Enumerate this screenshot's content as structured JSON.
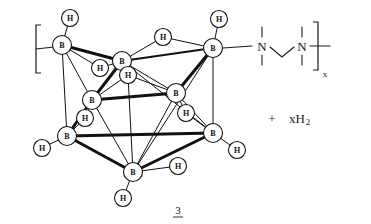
{
  "figure": {
    "kind": "chemical-reaction-scheme",
    "compound_number": "3",
    "compound_number_underlined": true,
    "description_labels": {
      "boron_vertex": "B",
      "hydrogen_atom": "H",
      "nitrogen_atom": "N"
    }
  },
  "colors": {
    "ink": "#111111",
    "text": "#1a1a1a",
    "background": "#ffffff",
    "node_fill": "#ffffff"
  },
  "cluster": {
    "name": "polyhedral-borane-cage",
    "boron_vertices": [
      {
        "id": "B1",
        "label": "B",
        "x": 62,
        "y": 45
      },
      {
        "id": "B2",
        "label": "B",
        "x": 122,
        "y": 61
      },
      {
        "id": "B3",
        "label": "B",
        "x": 213,
        "y": 48
      },
      {
        "id": "B4",
        "label": "B",
        "x": 92,
        "y": 100
      },
      {
        "id": "B5",
        "label": "B",
        "x": 176,
        "y": 93
      },
      {
        "id": "B6",
        "label": "B",
        "x": 67,
        "y": 136
      },
      {
        "id": "B7",
        "label": "B",
        "x": 213,
        "y": 133
      },
      {
        "id": "B8",
        "label": "B",
        "x": 133,
        "y": 172
      }
    ],
    "terminal_hydrogens": [
      {
        "id": "H1",
        "label": "H",
        "x": 70,
        "y": 18,
        "bonded_to": "B1"
      },
      {
        "id": "H2",
        "label": "H",
        "x": 219,
        "y": 19,
        "bonded_to": "B3"
      },
      {
        "id": "H3",
        "label": "H",
        "x": 42,
        "y": 148,
        "bonded_to": "B6"
      },
      {
        "id": "H4",
        "label": "H",
        "x": 237,
        "y": 150,
        "bonded_to": "B7"
      },
      {
        "id": "H5",
        "label": "H",
        "x": 123,
        "y": 198,
        "bonded_to": "B8"
      },
      {
        "id": "H6",
        "label": "H",
        "x": 178,
        "y": 166,
        "bonded_to": "B8"
      }
    ],
    "bridging_hydrogens": [
      {
        "id": "Hb1",
        "label": "H",
        "x": 163,
        "y": 37,
        "bridges": [
          "B2",
          "B3"
        ]
      },
      {
        "id": "Hb2",
        "label": "H",
        "x": 100,
        "y": 68,
        "bridges": [
          "B1",
          "B2"
        ]
      },
      {
        "id": "Hb3",
        "label": "H",
        "x": 128,
        "y": 75,
        "bridges": [
          "B2",
          "B4"
        ]
      },
      {
        "id": "Hb4",
        "label": "H",
        "x": 85,
        "y": 118,
        "bridges": [
          "B4",
          "B6"
        ]
      },
      {
        "id": "Hb5",
        "label": "H",
        "x": 186,
        "y": 113,
        "bridges": [
          "B5",
          "B7"
        ]
      }
    ],
    "cage_bonds": [
      {
        "from": "B1",
        "to": "B2",
        "weight": "thick"
      },
      {
        "from": "B1",
        "to": "B4",
        "weight": "thin"
      },
      {
        "from": "B1",
        "to": "B6",
        "weight": "thin"
      },
      {
        "from": "B2",
        "to": "B3",
        "weight": "med"
      },
      {
        "from": "B2",
        "to": "B4",
        "weight": "thick"
      },
      {
        "from": "B2",
        "to": "B5",
        "weight": "thin"
      },
      {
        "from": "B3",
        "to": "B5",
        "weight": "thick"
      },
      {
        "from": "B3",
        "to": "B7",
        "weight": "thin"
      },
      {
        "from": "B4",
        "to": "B5",
        "weight": "thick"
      },
      {
        "from": "B4",
        "to": "B6",
        "weight": "thick"
      },
      {
        "from": "B4",
        "to": "B8",
        "weight": "thin"
      },
      {
        "from": "B5",
        "to": "B7",
        "weight": "thin"
      },
      {
        "from": "B5",
        "to": "B8",
        "weight": "thin"
      },
      {
        "from": "B6",
        "to": "B7",
        "weight": "thick"
      },
      {
        "from": "B6",
        "to": "B8",
        "weight": "thick"
      },
      {
        "from": "B7",
        "to": "B8",
        "weight": "thick"
      },
      {
        "from": "B2",
        "to": "B7",
        "weight": "thin"
      },
      {
        "from": "B3",
        "to": "B8",
        "weight": "thin"
      }
    ]
  },
  "polymer": {
    "left_bracket": {
      "x": 36,
      "y": 25,
      "height": 48
    },
    "right_bracket": {
      "x": 318,
      "y": 22,
      "height": 48
    },
    "repeat_subscript": "x",
    "nitrogen_left": {
      "label": "N",
      "x": 262,
      "y": 46
    },
    "nitrogen_right": {
      "label": "N",
      "x": 302,
      "y": 46
    },
    "backbone_note": "ethylene bridge between the two nitrogen atoms",
    "bond_to_cage": "B3 bonded through the right side to the left nitrogen"
  },
  "byproduct": {
    "plus_sign": "+",
    "formula_main": "xH",
    "formula_subscript": "2",
    "x": 293,
    "y": 118
  }
}
